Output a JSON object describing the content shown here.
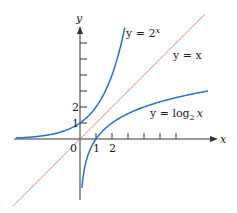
{
  "chart_data": {
    "type": "line",
    "title": "",
    "xlabel": "x",
    "ylabel": "y",
    "xlim": [
      -4,
      8.5
    ],
    "ylim": [
      -3.8,
      7
    ],
    "x_ticks": [
      1,
      2,
      3,
      4,
      5,
      6
    ],
    "x_tick_labels": [
      "1",
      "2"
    ],
    "y_ticks": [
      1,
      2,
      3,
      4,
      5,
      6
    ],
    "y_tick_labels": [
      "1",
      "2"
    ],
    "origin_label": "0",
    "grid": false,
    "series": [
      {
        "name": "y = 2^x",
        "label": "y = 2",
        "label_sup": "x",
        "color": "#2a6fc9",
        "function": "2^x",
        "x_range": [
          -4,
          2.8
        ]
      },
      {
        "name": "y = x",
        "label": "y = x",
        "color": "#e07b6e",
        "function": "x",
        "x_range": [
          -4.2,
          7.8
        ]
      },
      {
        "name": "y = log_2 x",
        "label": "y = log",
        "label_sub": "2",
        "label_tail": "x",
        "color": "#2a6fc9",
        "function": "log2(x)",
        "x_range": [
          0.12,
          8
        ]
      }
    ]
  }
}
